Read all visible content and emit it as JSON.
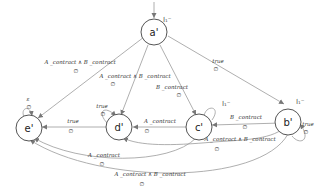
{
  "diagram": {
    "type": "state-machine",
    "nodes": [
      {
        "id": "a",
        "label": "a'",
        "initial": true,
        "initial_label": "I₁⁻"
      },
      {
        "id": "b",
        "label": "b'",
        "initial": true,
        "initial_label": "I₁⁻"
      },
      {
        "id": "c",
        "label": "c'",
        "initial": true,
        "initial_label": "I₁⁻"
      },
      {
        "id": "d",
        "label": "d'"
      },
      {
        "id": "e",
        "label": "e'"
      }
    ],
    "edges": [
      {
        "from": "a",
        "to": "e",
        "guard": "A _contract ∧ B _contract",
        "output": "∅"
      },
      {
        "from": "a",
        "to": "d",
        "guard": "A _contract ∧ B _contract",
        "output": "∅"
      },
      {
        "from": "a",
        "to": "c",
        "guard": "B _contract",
        "output": "∅"
      },
      {
        "from": "a",
        "to": "b",
        "guard": "true",
        "output": "∅"
      },
      {
        "from": "e",
        "to": "e",
        "guard": "ε",
        "output": "∅"
      },
      {
        "from": "d",
        "to": "d",
        "guard": "true",
        "output": "∅"
      },
      {
        "from": "d",
        "to": "e",
        "guard": "true",
        "output": "∅"
      },
      {
        "from": "c",
        "to": "d",
        "guard": "A _contract",
        "output": "∅"
      },
      {
        "from": "b",
        "to": "c",
        "guard": "B _contract",
        "output": "∅"
      },
      {
        "from": "b",
        "to": "b",
        "guard": "true",
        "output": "∅"
      },
      {
        "from": "b",
        "to": "d",
        "guard": "A _contract ∧ B _contract",
        "output": "∅"
      },
      {
        "from": "c",
        "to": "e",
        "guard": "A _contract",
        "output": "∅"
      },
      {
        "from": "b",
        "to": "e",
        "guard": "A _contract ∧ B _contract",
        "output": "∅"
      }
    ]
  }
}
